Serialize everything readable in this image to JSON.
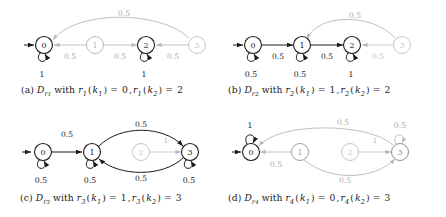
{
  "figure": {
    "colors": {
      "active": "#1a1a1a",
      "inactive": "#b9b9b9",
      "label_active": "#1a1a1a",
      "label_inactive": "#a8a8a8",
      "background": "#ffffff"
    },
    "panels": [
      {
        "id": "a",
        "caption_parts": {
          "tag": "(a)",
          "automaton": "D",
          "automaton_sub": "r",
          "automaton_sub2": "1",
          "with": "with",
          "fn": "r",
          "fn_sub": "1",
          "arg1": "k",
          "arg1_sub": "1",
          "val1": "0",
          "arg2": "k",
          "arg2_sub": "2",
          "val2": "2"
        },
        "caption_text": "(a) D_r1 with r1(k1) = 0, r1(k2) = 2",
        "nodes": [
          {
            "label": "0",
            "x": 44,
            "y": 45,
            "state": "active",
            "start": true
          },
          {
            "label": "1",
            "x": 95,
            "y": 45,
            "state": "inactive",
            "start": false
          },
          {
            "label": "2",
            "x": 146,
            "y": 45,
            "state": "active",
            "start": false
          },
          {
            "label": "3",
            "x": 197,
            "y": 45,
            "state": "inactive",
            "start": false
          }
        ],
        "self_loops": [
          {
            "node": "0",
            "label": "1",
            "state": "active"
          },
          {
            "node": "2",
            "label": "1",
            "state": "active"
          }
        ],
        "edges": [
          {
            "from": "1",
            "to": "0",
            "label": "0.5",
            "state": "inactive",
            "shape": "straight"
          },
          {
            "from": "1",
            "to": "2",
            "label": "0.5",
            "state": "inactive",
            "shape": "straight"
          },
          {
            "from": "3",
            "to": "2",
            "label": "0.5",
            "state": "inactive",
            "shape": "straight"
          },
          {
            "from": "3",
            "to": "0",
            "label": "0.5",
            "state": "inactive",
            "shape": "arc-above"
          }
        ]
      },
      {
        "id": "b",
        "caption_parts": {
          "tag": "(b)",
          "automaton": "D",
          "automaton_sub": "r",
          "automaton_sub2": "2",
          "with": "with",
          "fn": "r",
          "fn_sub": "2",
          "arg1": "k",
          "arg1_sub": "1",
          "val1": "1",
          "arg2": "k",
          "arg2_sub": "2",
          "val2": "2"
        },
        "caption_text": "(b) D_r2 with r2(k1) = 1, r2(k2) = 2",
        "nodes": [
          {
            "label": "0",
            "x": 253,
            "y": 45,
            "state": "active",
            "start": true
          },
          {
            "label": "1",
            "x": 302,
            "y": 45,
            "state": "active",
            "start": false
          },
          {
            "label": "2",
            "x": 352,
            "y": 45,
            "state": "active",
            "start": false
          },
          {
            "label": "3",
            "x": 402,
            "y": 45,
            "state": "inactive",
            "start": false
          }
        ],
        "self_loops": [
          {
            "node": "0",
            "label": "0.5",
            "state": "active"
          },
          {
            "node": "1",
            "label": "0.5",
            "state": "active"
          },
          {
            "node": "2",
            "label": "1",
            "state": "active"
          }
        ],
        "edges": [
          {
            "from": "0",
            "to": "1",
            "label": "0.5",
            "state": "active",
            "shape": "straight"
          },
          {
            "from": "1",
            "to": "2",
            "label": "0.5",
            "state": "active",
            "shape": "straight"
          },
          {
            "from": "3",
            "to": "2",
            "label": "0.5",
            "state": "inactive",
            "shape": "straight"
          },
          {
            "from": "3",
            "to": "1",
            "label": "0.5",
            "state": "inactive",
            "shape": "arc-above"
          }
        ]
      },
      {
        "id": "c",
        "caption_parts": {
          "tag": "(c)",
          "automaton": "D",
          "automaton_sub": "r",
          "automaton_sub2": "3",
          "with": "with",
          "fn": "r",
          "fn_sub": "3",
          "arg1": "k",
          "arg1_sub": "1",
          "val1": "1",
          "arg2": "k",
          "arg2_sub": "2",
          "val2": "3"
        },
        "caption_text": "(c) D_r3 with r3(k1) = 1, r3(k2) = 3",
        "nodes": [
          {
            "label": "0",
            "x": 43,
            "y": 152,
            "state": "active",
            "start": true
          },
          {
            "label": "1",
            "x": 92,
            "y": 152,
            "state": "active",
            "start": false
          },
          {
            "label": "2",
            "x": 141,
            "y": 152,
            "state": "inactive",
            "start": false
          },
          {
            "label": "3",
            "x": 190,
            "y": 152,
            "state": "active",
            "start": false
          }
        ],
        "self_loops": [
          {
            "node": "0",
            "label": "0.5",
            "state": "active"
          },
          {
            "node": "1",
            "label": "0.5",
            "state": "active"
          },
          {
            "node": "3",
            "label": "0.5",
            "state": "active"
          }
        ],
        "edges": [
          {
            "from": "0",
            "to": "1",
            "label": "0.5",
            "state": "active",
            "shape": "straight"
          },
          {
            "from": "1",
            "to": "3",
            "label": "0.5",
            "state": "active",
            "shape": "arc-above"
          },
          {
            "from": "3",
            "to": "1",
            "label": "0.5",
            "state": "active",
            "shape": "arc-below"
          },
          {
            "from": "2",
            "to": "3",
            "label": "1",
            "state": "inactive",
            "shape": "straight"
          }
        ]
      },
      {
        "id": "d",
        "caption_parts": {
          "tag": "(d)",
          "automaton": "D",
          "automaton_sub": "r",
          "automaton_sub2": "4",
          "with": "with",
          "fn": "r",
          "fn_sub": "4",
          "arg1": "k",
          "arg1_sub": "1",
          "val1": "0",
          "arg2": "k",
          "arg2_sub": "2",
          "val2": "3"
        },
        "caption_text": "(d) D_r4 with r4(k1) = 0, r4(k2) = 3",
        "nodes": [
          {
            "label": "0",
            "x": 251,
            "y": 152,
            "state": "active",
            "start": true
          },
          {
            "label": "1",
            "x": 300,
            "y": 152,
            "state": "inactive",
            "start": false
          },
          {
            "label": "2",
            "x": 350,
            "y": 152,
            "state": "inactive",
            "start": false
          },
          {
            "label": "3",
            "x": 400,
            "y": 152,
            "state": "active",
            "start": false
          }
        ],
        "self_loops": [
          {
            "node": "0",
            "label": "1",
            "state": "active"
          },
          {
            "node": "3",
            "label": "0.5",
            "state": "inactive"
          }
        ],
        "edges": [
          {
            "from": "1",
            "to": "0",
            "label": "0.5",
            "state": "inactive",
            "shape": "straight"
          },
          {
            "from": "3",
            "to": "0",
            "label": "0.5",
            "state": "inactive",
            "shape": "arc-above"
          },
          {
            "from": "1",
            "to": "3",
            "label": "0.5",
            "state": "inactive",
            "shape": "arc-below"
          },
          {
            "from": "2",
            "to": "3",
            "label": "1",
            "state": "inactive",
            "shape": "straight"
          }
        ]
      }
    ]
  }
}
